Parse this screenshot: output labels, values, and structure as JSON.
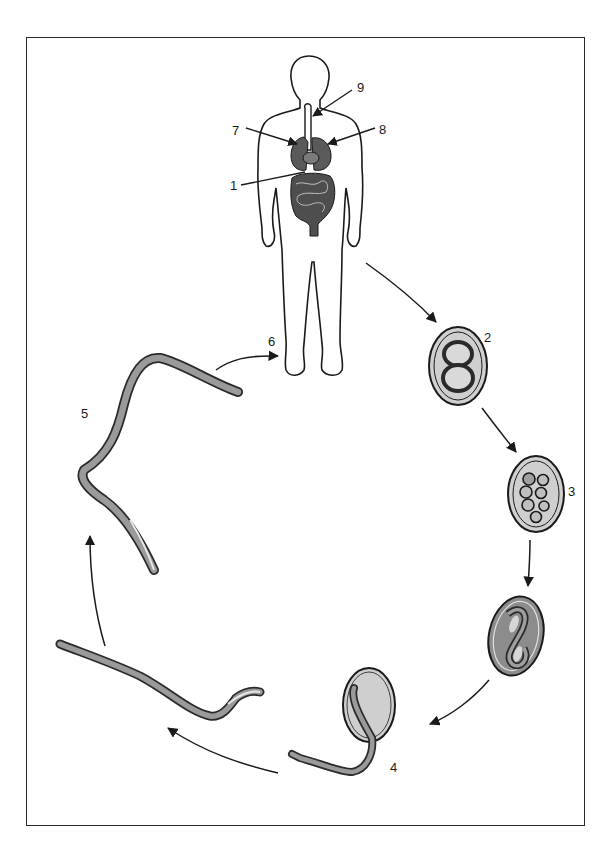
{
  "diagram": {
    "type": "life-cycle",
    "colors": {
      "line": "#1a1a1a",
      "organ_fill": "#5a5a5a",
      "egg_fill": "#cfcfcf",
      "egg_dark_fill": "#8c8c8c",
      "worm_fill": "#9a9a9a",
      "frame": "#2a2a2a"
    },
    "labels": {
      "l1": "1",
      "l2": "2",
      "l3": "3",
      "l4": "4",
      "l5": "5",
      "l6": "6",
      "l7": "7",
      "l8": "8",
      "l9": "9"
    },
    "stages": [
      {
        "id": "human-host",
        "description": "Human host body outline with internal organs (lungs, heart, trachea, intestines)"
      },
      {
        "id": "egg-2-cell",
        "label": "2",
        "description": "Egg with two-cell embryo"
      },
      {
        "id": "egg-morula",
        "label": "3",
        "description": "Egg with multicellular (morula) embryo"
      },
      {
        "id": "egg-larva",
        "description": "Egg containing coiled larva"
      },
      {
        "id": "hatching",
        "label": "4",
        "description": "Larva hatching from egg"
      },
      {
        "id": "larva-free",
        "description": "Free-living larva"
      },
      {
        "id": "infective-larva",
        "label": "5",
        "description": "Infective larva"
      },
      {
        "id": "penetration",
        "label": "6",
        "description": "Arrow to host foot (skin penetration)"
      }
    ],
    "pointers": [
      {
        "label": "1",
        "target": "intestine"
      },
      {
        "label": "7",
        "target": "right lung"
      },
      {
        "label": "8",
        "target": "left lung"
      },
      {
        "label": "9",
        "target": "trachea"
      }
    ]
  }
}
